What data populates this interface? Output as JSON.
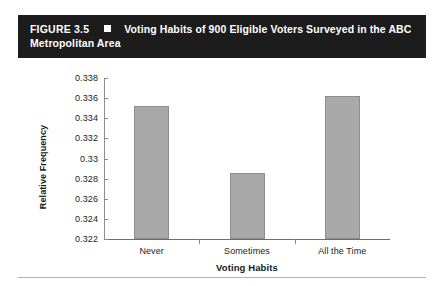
{
  "figure": {
    "number_label": "FIGURE 3.5",
    "bullet_icon": "white-square-bullet",
    "title": "Voting Habits of 900 Eligible Voters Surveyed in the ABC Metropolitan Area",
    "title_line1": "Voting Habits of 900 Eligible Voters Surveyed in the ABC",
    "title_line2": "Metropolitan Area",
    "banner_background": "#1c1c1c",
    "banner_text_color": "#ffffff"
  },
  "chart_data": {
    "type": "bar",
    "title": "Voting Habits of 900 Eligible Voters Surveyed in the ABC Metropolitan Area",
    "categories": [
      "Never",
      "Sometimes",
      "All the Time"
    ],
    "values": [
      0.3352,
      0.3286,
      0.3362
    ],
    "xlabel": "Voting Habits",
    "ylabel": "Relative Frequency",
    "ylim": [
      0.322,
      0.338
    ],
    "yticks": [
      "0.338",
      "0.336",
      "0.334",
      "0.332",
      "0.33",
      "0.328",
      "0.326",
      "0.324",
      "0.322"
    ],
    "ytick_values": [
      0.338,
      0.336,
      0.334,
      0.332,
      0.33,
      0.328,
      0.326,
      0.324,
      0.322
    ],
    "grid": false,
    "legend": false,
    "bar_fill_color": "#a9a9a9",
    "bar_edge_color": "#8d8d8d",
    "axis_color": "#8f8f8f"
  }
}
